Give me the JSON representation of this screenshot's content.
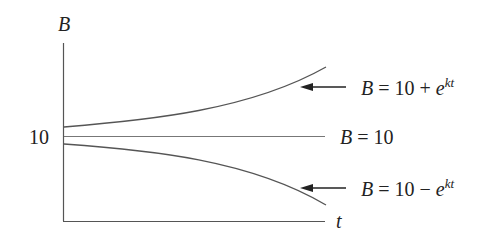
{
  "chart_data": {
    "type": "line",
    "title": "",
    "xlabel": "t",
    "ylabel": "B",
    "y_tick_labels": [
      "10"
    ],
    "grid": false,
    "series": [
      {
        "name": "B = 10 + e^kt",
        "shape": "increasing exponential above 10",
        "x": [
          0,
          0.25,
          0.5,
          0.75,
          1.0
        ],
        "values": [
          11,
          11.8,
          13.5,
          16.5,
          22.5
        ]
      },
      {
        "name": "B = 10",
        "shape": "constant",
        "x": [
          0,
          1.0
        ],
        "values": [
          10,
          10
        ]
      },
      {
        "name": "B = 10 - e^kt",
        "shape": "decreasing exponential below 10",
        "x": [
          0,
          0.25,
          0.5,
          0.75,
          1.0
        ],
        "values": [
          9,
          8.2,
          6.5,
          3.5,
          -2.5
        ]
      }
    ],
    "annotations": [
      "B = 10 + e^kt",
      "B = 10",
      "B = 10 - e^kt"
    ]
  },
  "axes": {
    "y_label": "B",
    "x_label": "t",
    "y_tick": "10"
  },
  "labels": {
    "upper": {
      "lhs": "B",
      "rhs": " = 10 + e",
      "exp": "kt"
    },
    "middle": {
      "lhs": "B",
      "rhs": " = 10"
    },
    "lower": {
      "lhs": "B",
      "rhs": " = 10 − e",
      "exp": "kt"
    }
  }
}
